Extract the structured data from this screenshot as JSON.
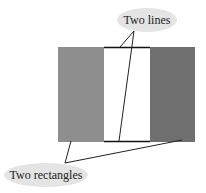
{
  "diagram": {
    "callouts": [
      {
        "id": "lines",
        "label": "Two lines"
      },
      {
        "id": "rects",
        "label": "Two rectangles"
      }
    ],
    "colors": {
      "left_rect": "#8e8e8e",
      "right_rect": "#6f6f6f",
      "center": "#ffffff",
      "line": "#111111",
      "bubble": "#e4e4e4"
    }
  }
}
